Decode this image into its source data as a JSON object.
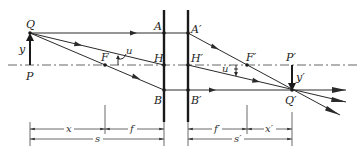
{
  "diagram": {
    "type": "thick-lens-principal-plane-imaging",
    "colors": {
      "line": "#2a2a2a",
      "axis": "#555555",
      "background": "#ffffff"
    },
    "labels": {
      "Q": "Q",
      "P": "P",
      "y": "y",
      "F": "F",
      "u": "u",
      "A": "A",
      "H": "H",
      "B": "B",
      "A_prime": "A′",
      "H_prime": "H′",
      "B_prime": "B′",
      "F_prime": "F′",
      "u_prime": "u′",
      "P_prime": "P′",
      "y_prime": "y′",
      "Q_prime": "Q′"
    },
    "dimensions": {
      "x": "x",
      "f": "f",
      "s": "s",
      "f_prime": "f′",
      "x_prime": "x′",
      "s_prime": "s′"
    }
  }
}
